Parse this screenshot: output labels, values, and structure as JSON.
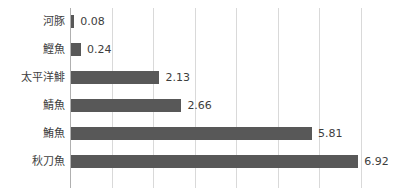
{
  "chart_data": {
    "type": "bar",
    "orientation": "horizontal",
    "title": "",
    "xlabel": "",
    "ylabel": "",
    "xlim": [
      0,
      8
    ],
    "grid": true,
    "gridlines": [
      0,
      1,
      2,
      3,
      4,
      5,
      6,
      7
    ],
    "legend": "none",
    "series_color": "#585858",
    "categories": [
      "河豚",
      "鰹魚",
      "太平洋鯡",
      "鯖魚",
      "鮪魚",
      "秋刀魚"
    ],
    "values": [
      0.08,
      0.24,
      2.13,
      2.66,
      5.81,
      6.92
    ],
    "value_labels": [
      "0.08",
      "0.24",
      "2.13",
      "2.66",
      "5.81",
      "6.92"
    ],
    "rows": [
      {
        "label": "河豚",
        "value": 0.08,
        "value_label": "0.08"
      },
      {
        "label": "鰹魚",
        "value": 0.24,
        "value_label": "0.24"
      },
      {
        "label": "太平洋鯡",
        "value": 2.13,
        "value_label": "2.13"
      },
      {
        "label": "鯖魚",
        "value": 2.66,
        "value_label": "2.66"
      },
      {
        "label": "鮪魚",
        "value": 5.81,
        "value_label": "5.81"
      },
      {
        "label": "秋刀魚",
        "value": 6.92,
        "value_label": "6.92"
      }
    ]
  },
  "colors": {
    "bar": "#585858",
    "grid": "#d9d9d9",
    "axis": "#b0b0b0",
    "label_text": "#404040",
    "value_text": "#3d3d3d",
    "background": "#ffffff"
  }
}
